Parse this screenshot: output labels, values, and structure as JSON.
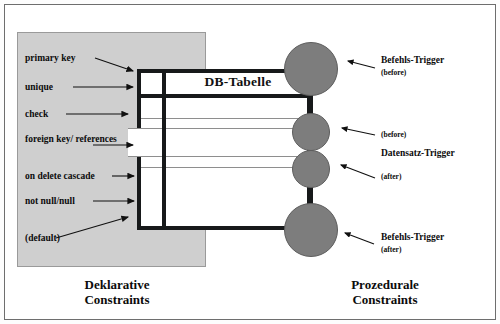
{
  "diagram": {
    "table_title": "DB-Tabelle",
    "left_caption": "Deklarative\nConstraints",
    "right_caption": "Prozedurale\nConstraints",
    "colors": {
      "node_fill": "#7d7d7d",
      "panel_fill": "#cfcfcf",
      "line": "#17191a",
      "background": "#ffffff"
    },
    "declarative_constraints": [
      {
        "label": "primary key"
      },
      {
        "label": "unique"
      },
      {
        "label": "check"
      },
      {
        "label": "foreign key/ references"
      },
      {
        "label": "on delete cascade"
      },
      {
        "label": "not null/null"
      },
      {
        "label": "(default)"
      }
    ],
    "procedural_triggers": [
      {
        "label": "Befehls-Trigger",
        "timing": "(before)"
      },
      {
        "label": "",
        "timing": "(before)"
      },
      {
        "label": "Datensatz-Trigger",
        "timing": "(after)"
      },
      {
        "label": "Befehls-Trigger",
        "timing": "(after)"
      }
    ]
  }
}
